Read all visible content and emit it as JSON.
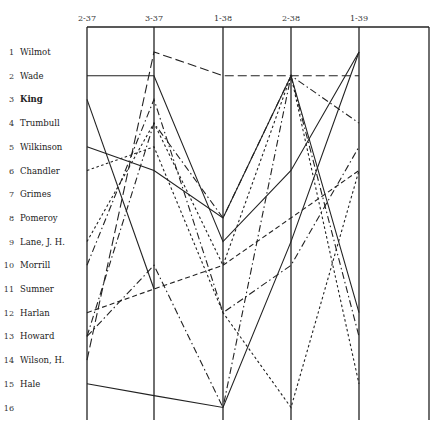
{
  "chart_data": {
    "type": "line",
    "title": "",
    "xlabel": "",
    "ylabel": "",
    "x": [
      "2-37",
      "3-37",
      "1-38",
      "2-38",
      "1-39"
    ],
    "rows": [
      {
        "num": "1",
        "name": "Wilmot",
        "bold": false
      },
      {
        "num": "2",
        "name": "Wade",
        "bold": false
      },
      {
        "num": "3",
        "name": "King",
        "bold": true
      },
      {
        "num": "4",
        "name": "Trumbull",
        "bold": false
      },
      {
        "num": "5",
        "name": "Wilkinson",
        "bold": false
      },
      {
        "num": "6",
        "name": "Chandler",
        "bold": false
      },
      {
        "num": "7",
        "name": "Grimes",
        "bold": false
      },
      {
        "num": "8",
        "name": "Pomeroy",
        "bold": false
      },
      {
        "num": "9",
        "name": "Lane, J. H.",
        "bold": false
      },
      {
        "num": "10",
        "name": "Morrill",
        "bold": false
      },
      {
        "num": "11",
        "name": "Sumner",
        "bold": false
      },
      {
        "num": "12",
        "name": "Harlan",
        "bold": false
      },
      {
        "num": "13",
        "name": "Howard",
        "bold": false
      },
      {
        "num": "14",
        "name": "Wilson, H.",
        "bold": false
      },
      {
        "num": "15",
        "name": "Hale",
        "bold": false
      },
      {
        "num": "16",
        "name": "",
        "bold": false
      }
    ],
    "ylim": [
      1,
      16
    ],
    "grid": false,
    "series": [
      {
        "name": "solid-a",
        "style": "solid",
        "values": [
          2,
          2,
          9,
          6,
          1
        ]
      },
      {
        "name": "long-dash",
        "style": "longdash",
        "values": [
          14,
          1,
          2,
          2,
          2
        ]
      },
      {
        "name": "solid-b",
        "style": "solid",
        "values": [
          3,
          11,
          null,
          null,
          null
        ]
      },
      {
        "name": "solid-c",
        "style": "solid",
        "values": [
          5,
          6,
          8,
          2,
          12
        ]
      },
      {
        "name": "solid-d",
        "style": "solid",
        "values": [
          15,
          15.5,
          16,
          9,
          1
        ]
      },
      {
        "name": "dotted-a",
        "style": "dotted",
        "values": [
          6,
          5,
          12,
          16,
          6
        ]
      },
      {
        "name": "dash-dot-a",
        "style": "dashdot",
        "values": [
          13,
          4,
          8,
          2,
          4
        ]
      },
      {
        "name": "dash-dot-b",
        "style": "dashdot",
        "values": [
          10,
          3,
          12,
          10,
          5
        ]
      },
      {
        "name": "dotted-b",
        "style": "dotted",
        "values": [
          9,
          4,
          10,
          2,
          15
        ]
      },
      {
        "name": "dash-a",
        "style": "dash",
        "values": [
          12,
          11,
          10,
          8,
          6
        ]
      },
      {
        "name": "dash-dot-c",
        "style": "dashdot",
        "values": [
          13,
          10,
          16,
          2,
          13
        ]
      }
    ]
  }
}
